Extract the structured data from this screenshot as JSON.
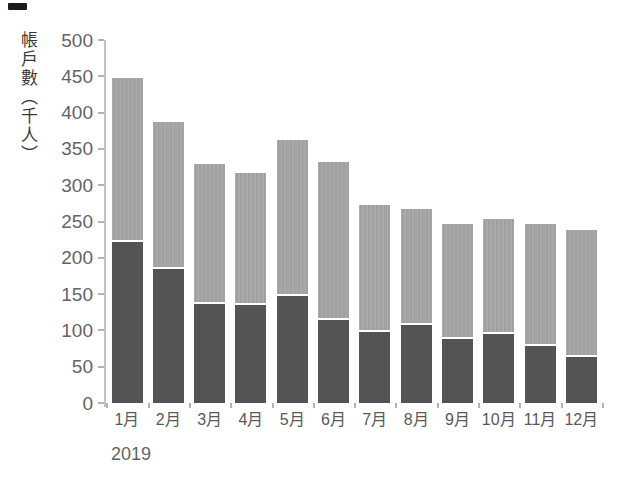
{
  "page": {
    "background": "#ffffff"
  },
  "y_axis": {
    "label": "帳戶數（千人）",
    "ticks": [
      "0",
      "50",
      "100",
      "150",
      "200",
      "250",
      "300",
      "350",
      "400",
      "450",
      "500"
    ]
  },
  "x_axis": {
    "year_label": "2019",
    "months": [
      "1月",
      "2月",
      "3月",
      "4月",
      "5月",
      "6月",
      "7月",
      "8月",
      "9月",
      "10月",
      "11月",
      "12月"
    ]
  },
  "artifact": {
    "scan_mark_color": "#1a1a21"
  },
  "chart_data": {
    "type": "bar",
    "stacked": true,
    "title": "",
    "xlabel": "2019",
    "ylabel": "帳戶數（千人）",
    "categories": [
      "1月",
      "2月",
      "3月",
      "4月",
      "5月",
      "6月",
      "7月",
      "8月",
      "9月",
      "10月",
      "11月",
      "12月"
    ],
    "series": [
      {
        "name": "lower-dark-segment",
        "color": "#545456",
        "values": [
          222,
          185,
          137,
          135,
          148,
          114,
          98,
          107,
          88,
          95,
          79,
          64
        ]
      },
      {
        "name": "upper-light-segment",
        "color": "#a3a4a6",
        "values": [
          225,
          202,
          192,
          182,
          214,
          218,
          175,
          160,
          158,
          158,
          167,
          174
        ]
      }
    ],
    "totals": [
      447,
      387,
      329,
      317,
      362,
      332,
      273,
      267,
      246,
      253,
      246,
      238
    ],
    "ylim": [
      0,
      500
    ],
    "ytick_step": 50,
    "grid": false,
    "legend": "none"
  }
}
